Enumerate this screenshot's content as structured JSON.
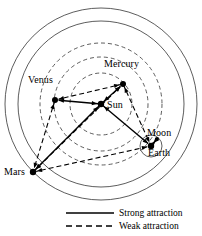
{
  "figure": {
    "type": "diagram",
    "background_color": "#ffffff",
    "line_color": "#000000",
    "orbit_color": "#333333"
  },
  "bodies": [
    {
      "id": "sun",
      "label": "Sun",
      "x": 101,
      "y": 104,
      "node_r": 3.2,
      "label_x": 107,
      "label_y": 100
    },
    {
      "id": "mercury",
      "label": "Mercury",
      "x": 123,
      "y": 84,
      "node_r": 3.0,
      "label_x": 104,
      "label_y": 59
    },
    {
      "id": "venus",
      "label": "Venus",
      "x": 55,
      "y": 100,
      "node_r": 3.0,
      "label_x": 28,
      "label_y": 75
    },
    {
      "id": "earth",
      "label": "Earth",
      "x": 151,
      "y": 146,
      "node_r": 3.2,
      "label_x": 148,
      "label_y": 148
    },
    {
      "id": "moon",
      "label": "Moon",
      "x": 157,
      "y": 139,
      "node_r": 2.0,
      "label_x": 147,
      "label_y": 128
    },
    {
      "id": "mars",
      "label": "Mars",
      "x": 33,
      "y": 172,
      "node_r": 3.2,
      "label_x": 4,
      "label_y": 167
    }
  ],
  "orbits": [
    {
      "id": "outer-boundary",
      "cx": 101,
      "cy": 104,
      "r": 96,
      "style": "solid"
    },
    {
      "id": "mars-orbit",
      "cx": 101,
      "cy": 104,
      "r": 83,
      "style": "solid"
    },
    {
      "id": "earth-orbit",
      "cx": 101,
      "cy": 104,
      "r": 61,
      "style": "dashed"
    },
    {
      "id": "venus-orbit",
      "cx": 101,
      "cy": 104,
      "r": 47,
      "style": "dashed"
    },
    {
      "id": "mercury-orbit",
      "cx": 101,
      "cy": 104,
      "r": 31,
      "style": "dashed"
    },
    {
      "id": "moon-orbit",
      "cx": 151,
      "cy": 146,
      "r": 11,
      "style": "solid"
    }
  ],
  "edges": [
    {
      "id": "sun-mercury",
      "from": "sun",
      "to": "mercury",
      "type": "strong"
    },
    {
      "id": "sun-venus",
      "from": "sun",
      "to": "venus",
      "type": "strong"
    },
    {
      "id": "sun-earth",
      "from": "sun",
      "to": "earth",
      "type": "strong"
    },
    {
      "id": "sun-mars",
      "from": "sun",
      "to": "mars",
      "type": "strong"
    },
    {
      "id": "earth-moon",
      "from": "earth",
      "to": "moon",
      "type": "strong"
    },
    {
      "id": "mercury-venus",
      "from": "mercury",
      "to": "venus",
      "type": "weak"
    },
    {
      "id": "venus-mars",
      "from": "venus",
      "to": "mars",
      "type": "weak"
    },
    {
      "id": "mercury-earth",
      "from": "mercury",
      "to": "earth",
      "type": "weak"
    },
    {
      "id": "mars-earth",
      "from": "mars",
      "to": "earth",
      "type": "weak"
    },
    {
      "id": "mars-mercury",
      "from": "mars",
      "to": "mercury",
      "type": "weak"
    }
  ],
  "legend": {
    "items": [
      {
        "id": "strong",
        "label": "Strong attraction",
        "style": "solid",
        "swatch_x": 66,
        "swatch_y": 213,
        "label_x": 119,
        "label_y": 208
      },
      {
        "id": "weak",
        "label": "Weak attraction",
        "style": "dashed",
        "swatch_x": 66,
        "swatch_y": 226,
        "label_x": 119,
        "label_y": 221
      }
    ],
    "swatch_width": 48
  }
}
